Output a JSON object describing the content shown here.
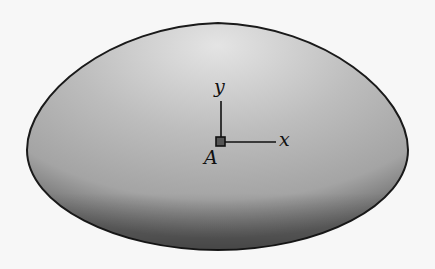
{
  "figure": {
    "labels": {
      "y_axis": "y",
      "x_axis": "x",
      "point": "A"
    },
    "colors": {
      "background": "#f7f7f7",
      "surface_light": "#e2e2e2",
      "surface_dark": "#7a7a7a",
      "outline": "#1a1a1a"
    }
  }
}
